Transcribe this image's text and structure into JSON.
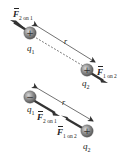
{
  "diagram": {
    "colors": {
      "charge_fill": "#8a8a8a",
      "arrow": "#333333",
      "dimension_line": "#333333",
      "text": "#222222"
    },
    "panels": [
      {
        "name": "like-charges-repel",
        "charge1": {
          "symbol": "q",
          "subscript": "1",
          "sign": "+"
        },
        "charge2": {
          "symbol": "q",
          "subscript": "2",
          "sign": "+"
        },
        "force_on_1": {
          "symbol": "F",
          "subscript": "2 on 1",
          "direction": "away-from-q2"
        },
        "force_on_2": {
          "symbol": "F",
          "subscript": "1 on 2",
          "direction": "away-from-q1"
        },
        "separation_label": "r"
      },
      {
        "name": "unlike-charges-attract",
        "charge1": {
          "symbol": "q",
          "subscript": "1",
          "sign": "−"
        },
        "charge2": {
          "symbol": "q",
          "subscript": "2",
          "sign": "+"
        },
        "force_on_1": {
          "symbol": "F",
          "subscript": "2 on 1",
          "direction": "toward-q2"
        },
        "force_on_2": {
          "symbol": "F",
          "subscript": "1 on 2",
          "direction": "toward-q1"
        },
        "separation_label": "r"
      }
    ]
  }
}
